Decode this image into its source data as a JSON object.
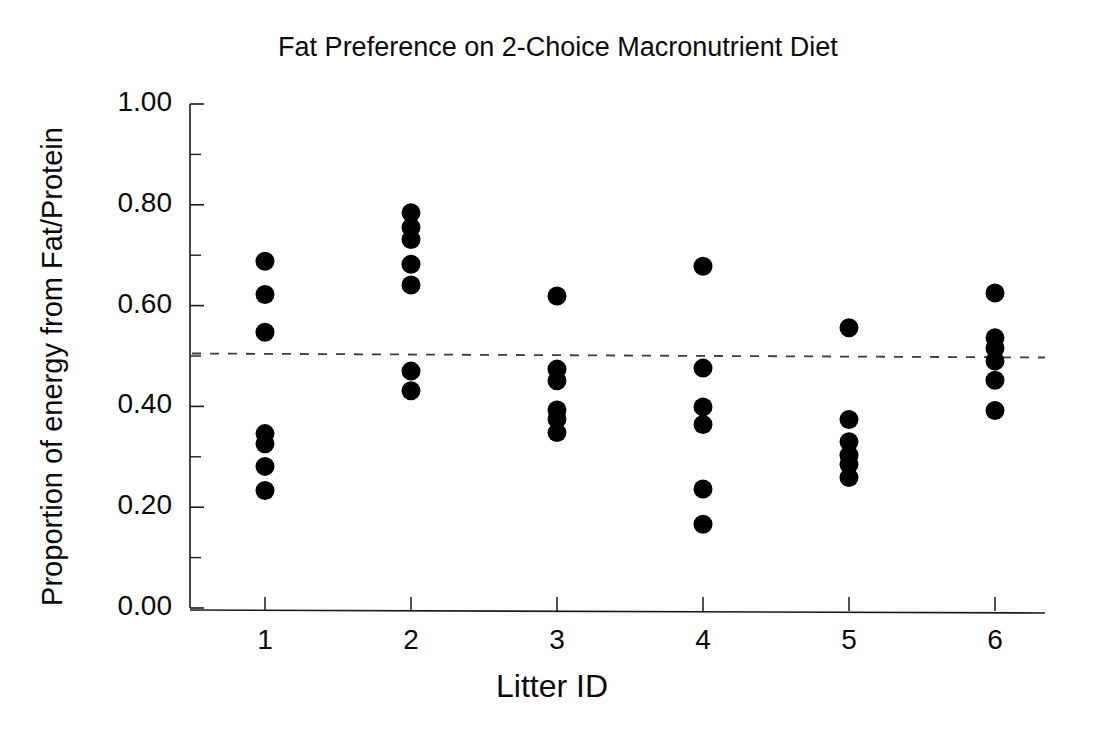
{
  "chart_data": {
    "type": "scatter",
    "title": "Fat Preference on 2-Choice Macronutrient Diet",
    "xlabel": "Litter ID",
    "ylabel": "Proportion of energy from Fat/Protein",
    "xlim": [
      0.45,
      6.75
    ],
    "ylim": [
      0.0,
      1.0
    ],
    "grid": false,
    "legend": null,
    "xticklabels": [
      "1",
      "2",
      "3",
      "4",
      "5",
      "6"
    ],
    "xtickvalues": [
      1,
      2,
      3,
      4,
      5,
      6
    ],
    "yticklabels": [
      "0.00",
      "0.20",
      "0.40",
      "0.60",
      "0.80",
      "1.00"
    ],
    "ytickvalues": [
      0.0,
      0.2,
      0.4,
      0.6,
      0.8,
      1.0
    ],
    "yminorticks": [
      0.1,
      0.3,
      0.5,
      0.7,
      0.9
    ],
    "marker": "filled-circle",
    "marker_color": "#000000",
    "marker_size_px": 19,
    "reference_line": {
      "label": "0.50 indifference line",
      "style": "dashed",
      "color": "#3c3c3c",
      "y_left": 0.505,
      "y_right": 0.497
    },
    "series": [
      {
        "name": "Litter 1",
        "x": 1,
        "values": [
          0.688,
          0.622,
          0.547,
          0.346,
          0.326,
          0.281,
          0.233
        ]
      },
      {
        "name": "Litter 2",
        "x": 2,
        "values": [
          0.784,
          0.755,
          0.731,
          0.682,
          0.641,
          0.47,
          0.431
        ]
      },
      {
        "name": "Litter 3",
        "x": 3,
        "values": [
          0.619,
          0.474,
          0.451,
          0.393,
          0.375,
          0.348
        ]
      },
      {
        "name": "Litter 4",
        "x": 4,
        "values": [
          0.678,
          0.476,
          0.399,
          0.364,
          0.236,
          0.166
        ]
      },
      {
        "name": "Litter 5",
        "x": 5,
        "values": [
          0.556,
          0.374,
          0.33,
          0.303,
          0.285,
          0.259
        ]
      },
      {
        "name": "Litter 6",
        "x": 6,
        "values": [
          0.625,
          0.536,
          0.516,
          0.49,
          0.452,
          0.392
        ]
      }
    ]
  },
  "figure": {
    "background_color": "#ffffff",
    "axis_color": "#1a1a1a"
  }
}
